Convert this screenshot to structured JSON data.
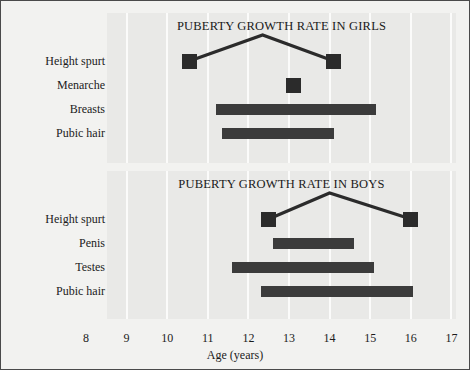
{
  "figure": {
    "background_color": "#f2f2f0",
    "border_color": "#4a4a4a",
    "panel_color": "#e9e9e7",
    "gridline_color": "#fbfbfa",
    "mark_color": "#3b3b3b"
  },
  "axis": {
    "title": "Age (years)",
    "ticks": [
      8,
      9,
      10,
      11,
      12,
      13,
      14,
      15,
      16,
      17
    ],
    "min": 8,
    "max": 17
  },
  "chart_data": [
    {
      "type": "bar",
      "orientation": "horizontal",
      "title": "PUBERTY GROWTH RATE IN GIRLS",
      "xlabel": "Age (years)",
      "ylabel": "",
      "xlim": [
        8,
        17
      ],
      "grid": true,
      "legend": "none",
      "categories": [
        "Height spurt",
        "Menarche",
        "Breasts",
        "Pubic hair"
      ],
      "items": [
        {
          "label": "Height spurt",
          "kind": "range-with-peak",
          "start": 10.55,
          "end": 14.1,
          "peak": 12.35,
          "note": "square markers at start and end joined by a peaked line"
        },
        {
          "label": "Menarche",
          "kind": "point",
          "start": 13.1,
          "end": 13.1,
          "note": "single square marker"
        },
        {
          "label": "Breasts",
          "kind": "range",
          "start": 11.2,
          "end": 15.15
        },
        {
          "label": "Pubic hair",
          "kind": "range",
          "start": 11.35,
          "end": 14.1
        }
      ]
    },
    {
      "type": "bar",
      "orientation": "horizontal",
      "title": "PUBERTY GROWTH RATE IN BOYS",
      "xlabel": "Age (years)",
      "ylabel": "",
      "xlim": [
        8,
        17
      ],
      "grid": true,
      "legend": "none",
      "categories": [
        "Height spurt",
        "Penis",
        "Testes",
        "Pubic hair"
      ],
      "items": [
        {
          "label": "Height spurt",
          "kind": "range-with-peak",
          "start": 12.5,
          "end": 16.0,
          "peak": 14.0,
          "note": "square markers at start and end joined by a peaked line"
        },
        {
          "label": "Penis",
          "kind": "range",
          "start": 12.6,
          "end": 14.6
        },
        {
          "label": "Testes",
          "kind": "range",
          "start": 11.6,
          "end": 15.1
        },
        {
          "label": "Pubic hair",
          "kind": "range",
          "start": 12.3,
          "end": 16.05
        }
      ]
    }
  ]
}
